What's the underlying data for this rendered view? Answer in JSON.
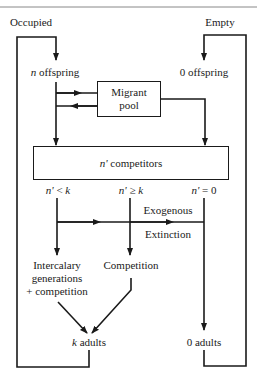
{
  "diagram": {
    "states": {
      "occupied": "Occupied",
      "empty": "Empty"
    },
    "offspring": {
      "n_var": "n",
      "n_label": " offspring",
      "zero_label": "0 offspring"
    },
    "migrant_pool": {
      "line1": "Migrant",
      "line2": "pool"
    },
    "competitors_box": {
      "var": "n'",
      "label": " competitors"
    },
    "conditions": {
      "less": {
        "var": "n'",
        "op": " < ",
        "k": "k"
      },
      "geq": {
        "var": "n'",
        "op": " ≥ ",
        "k": "k"
      },
      "zero": {
        "var": "n'",
        "op": " = 0"
      }
    },
    "exogenous": "Exogenous",
    "extinction": "Extinction",
    "outcomes": {
      "intercalary_line1": "Intercalary",
      "intercalary_line2": "generations",
      "intercalary_line3": "+ competition",
      "competition": "Competition"
    },
    "adults": {
      "k_var": "k",
      "k_label": " adults",
      "zero_label": "0 adults"
    },
    "colors": {
      "line": "#1a1a1a",
      "background": "#ffffff"
    }
  }
}
